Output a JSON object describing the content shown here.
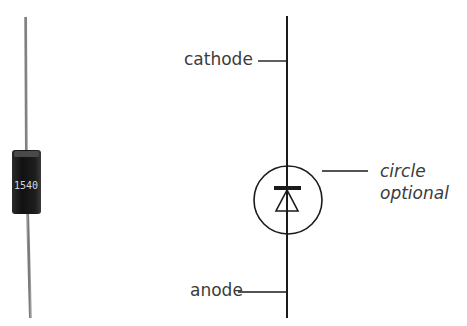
{
  "figure": {
    "photo": {
      "subject": "axial-lead diode",
      "body_marking": "1540",
      "body_color": "#1c1c1c",
      "lead_color": "#8a8a8a"
    },
    "symbol": {
      "name": "diode schematic symbol",
      "labels": {
        "cathode": "cathode",
        "anode": "anode",
        "note_line1": "circle",
        "note_line2": "optional"
      },
      "line_color": "#1a1a1a"
    }
  }
}
